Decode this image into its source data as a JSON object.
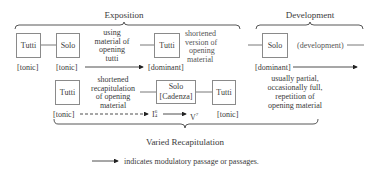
{
  "sections": {
    "exposition": "Exposition",
    "development": "Development",
    "recapitulation": "Varied Recapitulation"
  },
  "exposition": {
    "boxes": [
      {
        "label": "Tutti",
        "key": "[tonic]"
      },
      {
        "label": "Solo",
        "key": "[tonic]"
      },
      {
        "label": "Tutti",
        "key": "[dominant]"
      }
    ],
    "notes": {
      "solo_material": [
        "using",
        "material of",
        "opening",
        "tutti"
      ],
      "tutti_shortened": [
        "shortened",
        "version of",
        "opening",
        "material"
      ]
    }
  },
  "development": {
    "box": {
      "label": "Solo",
      "key": "[dominant]"
    },
    "text": "(development)",
    "note": [
      "usually partial,",
      "occasionally full,",
      "repetition of",
      "opening material"
    ]
  },
  "recapitulation": {
    "boxes": [
      {
        "label": "Tutti",
        "key": "[tonic]"
      },
      {
        "label": "Solo",
        "sublabel": "[Cadenza]"
      },
      {
        "label": "Tutti",
        "key": "[tonic]"
      }
    ],
    "note": [
      "shortened",
      "recapitulation",
      "of opening",
      "material"
    ],
    "chords": {
      "first": {
        "base": "I",
        "sup": "6",
        "sub": "4"
      },
      "second": {
        "base": "V",
        "sup": "7"
      }
    }
  },
  "legend": {
    "text": "indicates modulatory passage or passages."
  }
}
